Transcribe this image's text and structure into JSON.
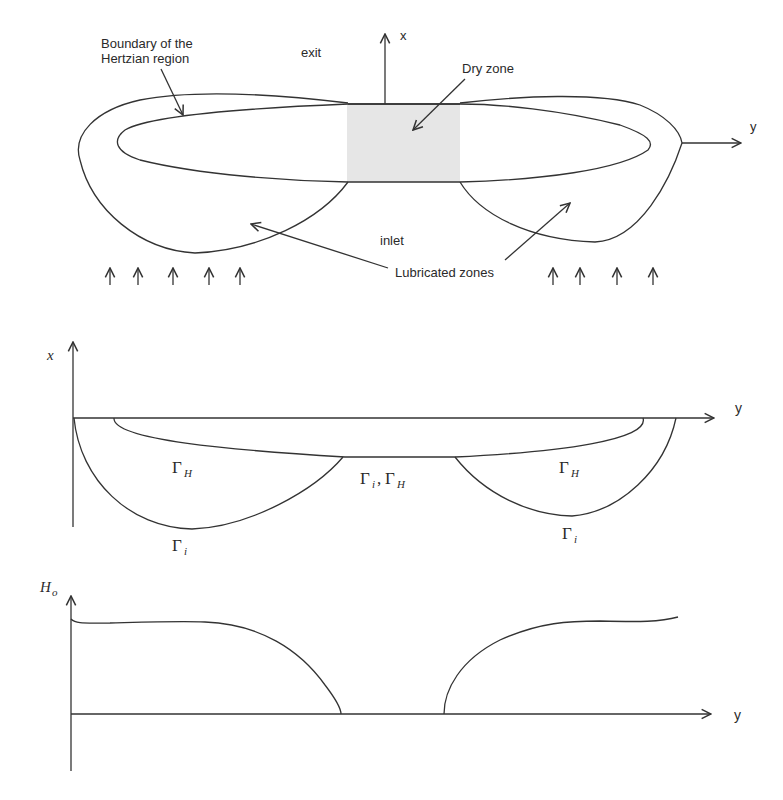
{
  "top_panel": {
    "labels": {
      "hertzian_boundary": [
        "Boundary of the",
        "Hertzian region"
      ],
      "exit": "exit",
      "x_axis": "x",
      "y_axis": "y",
      "dry_zone": "Dry zone",
      "inlet": "inlet",
      "lubricated_zones": "Lubricated zones"
    },
    "shade_color": "#e6e6e6",
    "inflow_arrows_left": 5,
    "inflow_arrows_right": 4
  },
  "middle_panel": {
    "x_axis": "x",
    "y_axis": "y",
    "labels": {
      "gamma": "Γ",
      "gamma_h_left_sub": "H",
      "gamma_mid": "Γ",
      "gamma_mid_sub": "i",
      "gamma_mid_sep": ",",
      "gamma_mid2": "Γ",
      "gamma_mid2_sub": "H",
      "gamma_h_right_sub": "H",
      "gamma_i_left_sub": "i",
      "gamma_i_right_sub": "i"
    }
  },
  "bottom_panel": {
    "y_label": "H",
    "y_label_sub": "o",
    "x_axis": "y"
  }
}
